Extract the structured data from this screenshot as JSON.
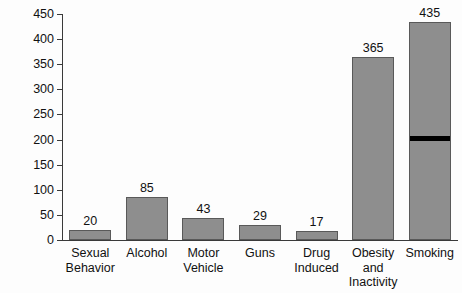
{
  "chart_data": {
    "type": "bar",
    "title": "",
    "xlabel": "",
    "ylabel": "No. of Deaths (thousands)",
    "ylim": [
      0,
      450
    ],
    "ytick_values": [
      0,
      50,
      100,
      150,
      200,
      250,
      300,
      350,
      400,
      450
    ],
    "ytick_labels": [
      "0",
      "50",
      "100",
      "150",
      "200",
      "250",
      "300",
      "350",
      "400",
      "450"
    ],
    "grid": false,
    "legend": "none",
    "categories": [
      "Sexual\nBehavior",
      "Alcohol",
      "Motor\nVehicle",
      "Guns",
      "Drug\nInduced",
      "Obesity\nand\nInactivity",
      "Smoking"
    ],
    "values": [
      20,
      85,
      43,
      29,
      17,
      365,
      435
    ],
    "value_labels": [
      "20",
      "85",
      "43",
      "29",
      "17",
      "365",
      "435"
    ],
    "annotations": [
      {
        "series_index": 6,
        "category": "Smoking",
        "type": "horizontal-marker-band",
        "value": 200,
        "color": "#000000"
      }
    ],
    "colors": {
      "bar_fill": "#8e8e8e",
      "bar_border": "#595959",
      "axis": "#3a3a3a",
      "text": "#111111",
      "background": "#fdfdfd",
      "marker": "#000000"
    }
  }
}
